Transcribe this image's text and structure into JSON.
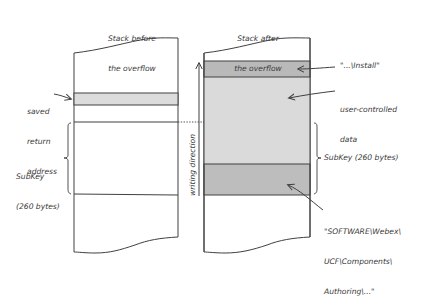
{
  "colors": {
    "stroke": "#404040",
    "saved_return_fill": "#dcdcdc",
    "install_fill": "#b9b9b9",
    "user_data_fill": "#dadada",
    "software_fill": "#bdbdbd",
    "text": "#3a3a3a",
    "background": "#ffffff"
  },
  "left_stack": {
    "title_line1": "Stack before",
    "title_line2": "the overflow",
    "saved_return_label_line1": "saved",
    "saved_return_label_line2": "return",
    "saved_return_label_line3": "address",
    "subkey_label_line1": "SubKey",
    "subkey_label_line2": "(260 bytes)"
  },
  "right_stack": {
    "title_line1": "Stack after",
    "title_line2": "the overflow",
    "install_label": "\"...\\Install\"",
    "user_data_label_line1": "user-controlled",
    "user_data_label_line2": "data",
    "subkey_label": "SubKey (260 bytes)",
    "software_label_line1": "\"SOFTWARE\\Webex\\",
    "software_label_line2": "UCF\\Components\\",
    "software_label_line3": "Authoring\\...\""
  },
  "writing_direction_label": "writing direction"
}
